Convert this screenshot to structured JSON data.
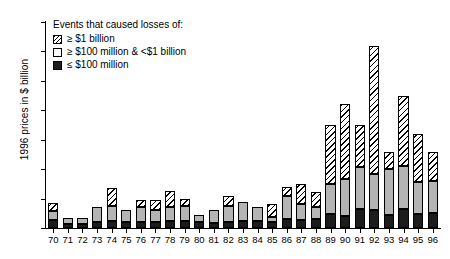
{
  "chart_data": {
    "type": "bar",
    "title": "",
    "subtitle": "",
    "xlabel": "",
    "ylabel": "1996 prices in $ billion",
    "ylim": [
      0,
      35
    ],
    "yticks": [
      0,
      5,
      10,
      15,
      20,
      25,
      30,
      35
    ],
    "grid": false,
    "stacked": true,
    "legend_position": "top-left",
    "legend_title": "Events that caused losses of:",
    "categories": [
      "70",
      "71",
      "72",
      "73",
      "74",
      "75",
      "76",
      "77",
      "78",
      "79",
      "80",
      "81",
      "82",
      "83",
      "84",
      "85",
      "86",
      "87",
      "88",
      "89",
      "90",
      "91",
      "92",
      "93",
      "94",
      "95",
      "96"
    ],
    "series": [
      {
        "name": "≤ $100 million",
        "swatch": "black",
        "color": "#1c1c1c",
        "values": [
          1.4,
          0.6,
          0.7,
          1.1,
          1.2,
          1.1,
          1.1,
          1.1,
          1.2,
          1.2,
          1.1,
          0.8,
          1.1,
          1.2,
          1.2,
          1.1,
          1.5,
          1.4,
          1.6,
          2.4,
          2.0,
          3.2,
          3.1,
          2.2,
          3.2,
          2.3,
          2.5
        ]
      },
      {
        "name": "≥ $100 million & <$1 billion",
        "swatch": "white",
        "color": "#b4b4b4",
        "values": [
          1.5,
          1.1,
          1.0,
          2.4,
          2.5,
          2.0,
          2.5,
          2.0,
          2.4,
          2.5,
          1.1,
          2.3,
          2.6,
          3.3,
          2.4,
          0.7,
          4.0,
          2.6,
          2.0,
          5.0,
          6.4,
          7.2,
          6.1,
          7.8,
          7.4,
          5.5,
          5.5
        ]
      },
      {
        "name": "≥ $1 billion",
        "swatch": "hatch",
        "color": "#ffffff",
        "values": [
          1.3,
          0.0,
          0.0,
          0.0,
          3.1,
          0.0,
          1.2,
          1.6,
          2.7,
          1.3,
          0.0,
          0.0,
          1.7,
          0.0,
          0.0,
          2.2,
          1.5,
          3.5,
          2.5,
          10.1,
          12.6,
          7.1,
          21.8,
          3.0,
          11.9,
          8.2,
          5.0
        ]
      }
    ],
    "totals": [
      4.2,
      1.7,
      1.7,
      3.5,
      6.8,
      3.1,
      4.8,
      4.7,
      6.3,
      5.0,
      2.2,
      3.1,
      5.4,
      4.5,
      3.6,
      4.0,
      7.0,
      7.5,
      6.1,
      17.5,
      21.0,
      17.5,
      31.0,
      13.0,
      22.5,
      16.0,
      13.0
    ]
  }
}
